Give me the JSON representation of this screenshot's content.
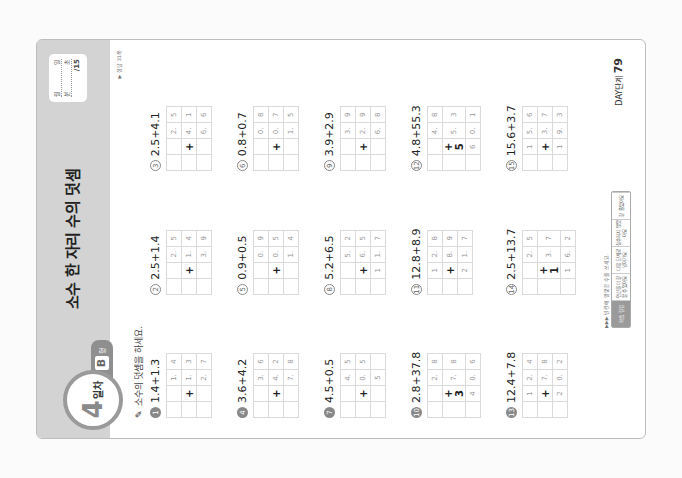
{
  "header": {
    "title": "소수 한 자리 수의 덧셈",
    "day_number": "4",
    "day_label": "일차",
    "form_letter": "B",
    "form_suffix": "형",
    "score_box": {
      "row1": [
        "월",
        "일"
      ],
      "row2": [
        "분",
        "초"
      ],
      "total": "/15"
    },
    "answer_ref": "▶ 정답 31쪽"
  },
  "instruction": "소수의 덧셈을 하세요.",
  "problems": [
    {
      "num": "1",
      "expr": "1.4+1.3",
      "rows": [
        [
          "",
          "",
          "1.",
          "4"
        ],
        [
          "",
          "+",
          "1.",
          "3"
        ],
        [
          "",
          "",
          "2.",
          "7"
        ]
      ]
    },
    {
      "num": "2",
      "expr": "2.5+1.4",
      "rows": [
        [
          "",
          "",
          "2.",
          "5"
        ],
        [
          "",
          "+",
          "1.",
          "4"
        ],
        [
          "",
          "",
          "3.",
          "9"
        ]
      ]
    },
    {
      "num": "3",
      "expr": "2.5+4.1",
      "rows": [
        [
          "",
          "",
          "2.",
          "5"
        ],
        [
          "",
          "+",
          "4.",
          "1"
        ],
        [
          "",
          "",
          "6.",
          "6"
        ]
      ]
    },
    {
      "num": "4",
      "expr": "3.6+4.2",
      "rows": [
        [
          "",
          "",
          "3.",
          "6"
        ],
        [
          "",
          "+",
          "4.",
          "2"
        ],
        [
          "",
          "",
          "7.",
          "8"
        ]
      ]
    },
    {
      "num": "5",
      "expr": "0.9+0.5",
      "rows": [
        [
          "",
          "",
          "0.",
          "9"
        ],
        [
          "",
          "+",
          "0.",
          "5"
        ],
        [
          "",
          "",
          "1.",
          "4"
        ]
      ]
    },
    {
      "num": "6",
      "expr": "0.8+0.7",
      "rows": [
        [
          "",
          "",
          "0.",
          "8"
        ],
        [
          "",
          "+",
          "0.",
          "7"
        ],
        [
          "",
          "",
          "1.",
          "5"
        ]
      ]
    },
    {
      "num": "7",
      "expr": "4.5+0.5",
      "rows": [
        [
          "",
          "",
          "4.",
          "5"
        ],
        [
          "",
          "+",
          "0.",
          "5"
        ],
        [
          "",
          "",
          "5",
          ""
        ]
      ]
    },
    {
      "num": "8",
      "expr": "5.2+6.5",
      "rows": [
        [
          "",
          "",
          "5.",
          "2"
        ],
        [
          "",
          "+",
          "6.",
          "5"
        ],
        [
          "",
          "1",
          "1.",
          "7"
        ]
      ]
    },
    {
      "num": "9",
      "expr": "3.9+2.9",
      "rows": [
        [
          "",
          "",
          "3.",
          "9"
        ],
        [
          "",
          "+",
          "2.",
          "9"
        ],
        [
          "",
          "",
          "6.",
          "8"
        ]
      ]
    },
    {
      "num": "10",
      "expr": "2.8+37.8",
      "rows": [
        [
          "",
          "",
          "2.",
          "8"
        ],
        [
          "",
          "+ 3",
          "7.",
          "8"
        ],
        [
          "",
          "4",
          "0.",
          "6"
        ]
      ]
    },
    {
      "num": "11",
      "expr": "12.8+8.9",
      "rows": [
        [
          "",
          "1",
          "2.",
          "8"
        ],
        [
          "",
          "+",
          "8.",
          "9"
        ],
        [
          "",
          "2",
          "1.",
          "7"
        ]
      ]
    },
    {
      "num": "12",
      "expr": "4.8+55.3",
      "rows": [
        [
          "",
          "",
          "4.",
          "8"
        ],
        [
          "",
          "+ 5",
          "5.",
          "3"
        ],
        [
          "",
          "6",
          "0.",
          "1"
        ]
      ]
    },
    {
      "num": "13",
      "expr": "12.4+7.8",
      "rows": [
        [
          "",
          "1",
          "2.",
          "4"
        ],
        [
          "",
          "+",
          "7.",
          "8"
        ],
        [
          "",
          "2",
          "0.",
          "2"
        ]
      ]
    },
    {
      "num": "14",
      "expr": "2.5+13.7",
      "rows": [
        [
          "",
          "",
          "2.",
          "5"
        ],
        [
          "",
          "+ 1",
          "3.",
          "7"
        ],
        [
          "",
          "1",
          "6.",
          "2"
        ]
      ]
    },
    {
      "num": "15",
      "expr": "15.6+3.7",
      "rows": [
        [
          "",
          "1",
          "5.",
          "6"
        ],
        [
          "",
          "+",
          "3.",
          "7"
        ],
        [
          "",
          "1",
          "9.",
          "3"
        ]
      ]
    }
  ],
  "footer": {
    "note": "▶▶▶ 빈칸에 알맞은 수를 쓰세요.",
    "cells": [
      "학습 점검",
      "연산을 더 잘 할 수 있어요",
      "다음 단계로 넘어가요",
      "실수하지 않았어요",
      "잘 풀었어요"
    ]
  },
  "page": {
    "label": "DAY단계",
    "number": "79"
  }
}
